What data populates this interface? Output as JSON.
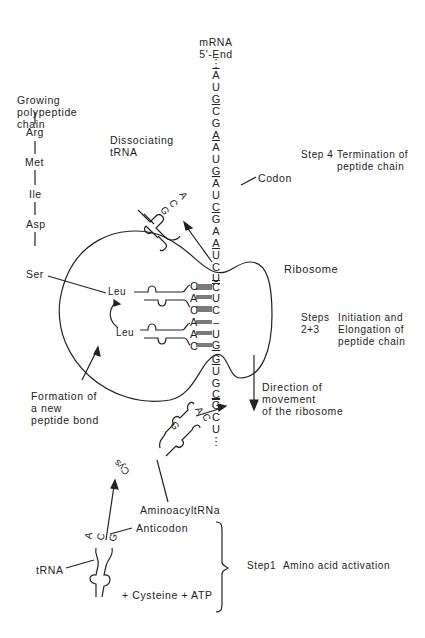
{
  "mrna": {
    "title": "mRNA",
    "end_label": "5'-End",
    "top_dots": "⋮",
    "bottom_dots": "⋮",
    "sequence_upper": [
      "A",
      "U",
      "G",
      "C",
      "G",
      "A",
      "A",
      "U",
      "G",
      "A",
      "U",
      "C",
      "G",
      "A",
      "A",
      "U",
      "C",
      "U"
    ],
    "sequence_ribosome": [
      "C",
      "U",
      "C",
      "–",
      "U",
      "G"
    ],
    "sequence_lower": [
      "G",
      "U",
      "G",
      "C",
      "G",
      "C",
      "U"
    ]
  },
  "polypeptide": {
    "title": "Growing\npolypeptide\nchain",
    "residues": [
      "Arg",
      "Met",
      "Ile",
      "Asp",
      "Ser"
    ]
  },
  "dissociating_trna": {
    "label": "Dissociating\ntRNA",
    "anticodon": [
      "A",
      "C",
      "G"
    ]
  },
  "codon_label": "Codon",
  "ribosome_label": "Ribosome",
  "steps": {
    "step4": {
      "num": "Step 4",
      "desc": "Termination of\npeptide chain"
    },
    "step23": {
      "num": "Steps\n2+3",
      "desc": "Initiation and\nElongation of\npeptide chain"
    },
    "step1": {
      "num": "Step1",
      "desc": "Amino acid activation"
    }
  },
  "ribosome_trnas": {
    "p_site": {
      "amino_acid": "Leu",
      "anticodon": [
        "C",
        "A",
        "C"
      ]
    },
    "a_site": {
      "amino_acid": "Leu",
      "anticodon": [
        "A",
        "A",
        "C"
      ]
    }
  },
  "peptide_bond_label": "Formation of\na new\npeptide bond",
  "direction_label": "Direction of\nmovement\nof the ribosome",
  "aminoacyl_trna": {
    "label": "AminoacyltRNa",
    "amino_acid": "Cys",
    "anticodon": [
      "A",
      "C",
      "G"
    ]
  },
  "free_trna": {
    "label": "tRNA",
    "anticodon_label": "Anticodon",
    "anticodon": [
      "A",
      "C",
      "G"
    ],
    "reactants": "+ Cysteine + ATP"
  }
}
